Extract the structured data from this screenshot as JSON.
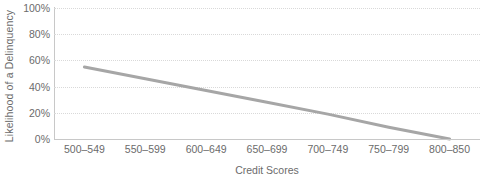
{
  "chart_data": {
    "type": "line",
    "title": "",
    "subtitle": "",
    "xlabel": "Credit Scores",
    "ylabel": "Likelihood of a Delinquency",
    "categories": [
      "500–549",
      "550–599",
      "600–649",
      "650–699",
      "700–749",
      "750–799",
      "800–850"
    ],
    "series": [
      {
        "name": "Likelihood of a Delinquency",
        "values": [
          55,
          46,
          37,
          28,
          19,
          9,
          0
        ],
        "color": "#a6a6a6"
      }
    ],
    "ylim": [
      0,
      100
    ],
    "yticks": [
      0,
      20,
      40,
      60,
      80,
      100
    ],
    "ytick_labels": [
      "0%",
      "20%",
      "40%",
      "60%",
      "80%",
      "100%"
    ],
    "grid": true,
    "grid_style": "dotted",
    "grid_color": "#d9d9d9",
    "legend": false,
    "legend_position": "none",
    "axis_color": "#c8c8c8",
    "text_color": "#6b6b6b",
    "background": "#ffffff"
  }
}
